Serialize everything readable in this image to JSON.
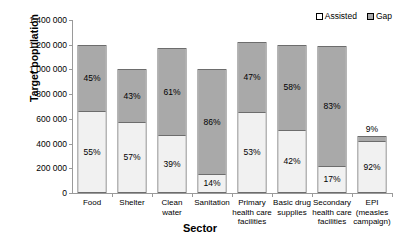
{
  "chart_data": {
    "type": "bar",
    "subtype": "stacked-bar",
    "title": "",
    "xlabel": "Sector",
    "ylabel": "Target population",
    "ylim": [
      0,
      1400000
    ],
    "yticks": [
      0,
      200000,
      400000,
      600000,
      800000,
      1000000,
      1200000,
      1400000
    ],
    "ytick_labels": [
      "0",
      "200 000",
      "400 000",
      "600 000",
      "800 000",
      "1 000 000",
      "1 200 000",
      "1 400 000"
    ],
    "grid": false,
    "legend_position": "top-right",
    "categories": [
      "Food",
      "Shelter",
      "Clean water",
      "Sanitation",
      "Primary health care facilities",
      "Basic drug supplies",
      "Secondary health care facilities",
      "EPI (measles campaign)"
    ],
    "category_lines": [
      [
        "Food"
      ],
      [
        "Shelter"
      ],
      [
        "Clean",
        "water"
      ],
      [
        "Sanitation"
      ],
      [
        "Primary",
        "health care",
        "facilities"
      ],
      [
        "Basic drug",
        "supplies"
      ],
      [
        "Secondary",
        "health care",
        "facilities"
      ],
      [
        "EPI",
        "(measles",
        "campaign)"
      ]
    ],
    "series": [
      {
        "name": "Assisted",
        "color": "#f1f1f1",
        "values": [
          660000,
          570000,
          458000,
          140000,
          649000,
          504000,
          202000,
          423000
        ],
        "labels": [
          "55%",
          "57%",
          "39%",
          "14%",
          "53%",
          "42%",
          "17%",
          "92%"
        ]
      },
      {
        "name": "Gap",
        "color": "#a9a9a9",
        "values": [
          540000,
          430000,
          717000,
          860000,
          576000,
          696000,
          988000,
          37000
        ],
        "labels": [
          "45%",
          "43%",
          "61%",
          "86%",
          "47%",
          "58%",
          "83%",
          "9%"
        ]
      }
    ],
    "totals": [
      1200000,
      1000000,
      1175000,
      1000000,
      1225000,
      1200000,
      1190000,
      460000
    ],
    "label_outside": [
      false,
      false,
      false,
      false,
      false,
      false,
      false,
      true
    ]
  },
  "legend": {
    "entries": [
      {
        "label": "Assisted",
        "swatch": "assisted"
      },
      {
        "label": "Gap",
        "swatch": "gap"
      }
    ]
  }
}
